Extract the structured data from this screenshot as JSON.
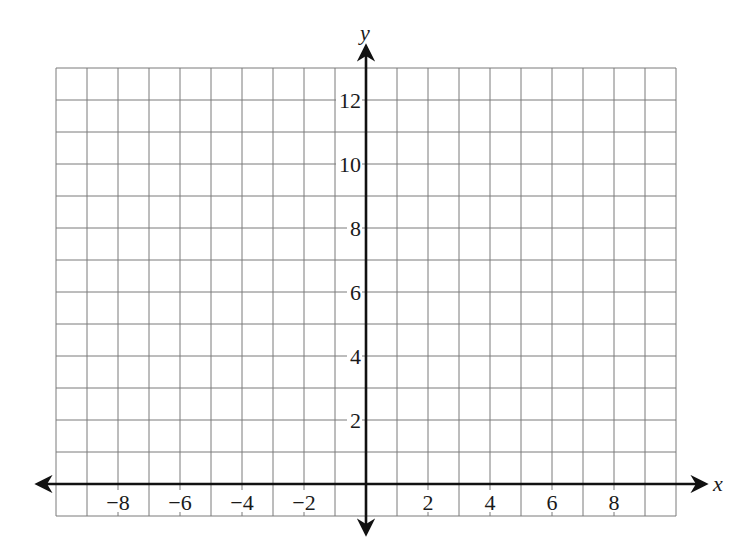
{
  "chart_data": {
    "type": "scatter",
    "title": "",
    "xlabel": "x",
    "ylabel": "y",
    "xlim": [
      -10,
      10
    ],
    "ylim": [
      -1,
      13
    ],
    "grid": true,
    "grid_step": 1,
    "x_ticks": [
      -8,
      -6,
      -4,
      -2,
      2,
      4,
      6,
      8
    ],
    "x_tick_labels": [
      "−8",
      "−6",
      "−4",
      "−2",
      "2",
      "4",
      "6",
      "8"
    ],
    "y_ticks": [
      2,
      4,
      6,
      8,
      10,
      12
    ],
    "y_tick_labels": [
      "2",
      "4",
      "6",
      "8",
      "10",
      "12"
    ],
    "series": [],
    "legend": null
  },
  "colors": {
    "grid": "#7a7a7a",
    "axis": "#111111",
    "background": "#ffffff"
  },
  "layout": {
    "origin_px": [
      366,
      484
    ],
    "unit_x_px": 31,
    "unit_y_px": 32
  }
}
